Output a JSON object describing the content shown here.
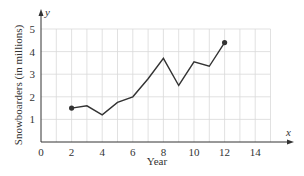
{
  "chart_data": {
    "type": "line",
    "title": "",
    "xlabel": "Year",
    "ylabel": "Snowboarders (in millions)",
    "x_axis_var": "x",
    "y_axis_var": "y",
    "xlim": [
      0,
      15
    ],
    "ylim": [
      0,
      5
    ],
    "x_ticks": [
      0,
      2,
      4,
      6,
      8,
      10,
      12,
      14
    ],
    "x_tick_labels": [
      "0",
      "2",
      "4",
      "6",
      "8",
      "10",
      "12",
      "14"
    ],
    "y_ticks": [
      1,
      2,
      3,
      4,
      5
    ],
    "y_tick_labels": [
      "1",
      "2",
      "3",
      "4",
      "5"
    ],
    "grid": true,
    "legend": null,
    "series": [
      {
        "name": "Snowboarders",
        "x": [
          2,
          3,
          4,
          5,
          6,
          7,
          8,
          9,
          10,
          11,
          12
        ],
        "values": [
          1.5,
          1.6,
          1.2,
          1.75,
          2.0,
          2.8,
          3.7,
          2.5,
          3.55,
          3.35,
          4.4
        ],
        "endpoints_marked": true
      }
    ],
    "colors": {
      "line": "#333333",
      "grid": "#d9d9d9",
      "axis": "#333333"
    }
  }
}
